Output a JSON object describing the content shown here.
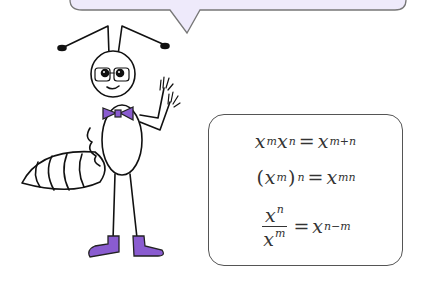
{
  "speech_bubble": {
    "text": "",
    "fill": "#eeeafb",
    "stroke": "#777777"
  },
  "character": {
    "accent_color": "#8a5cd0",
    "description": "cartoon ant with glasses, bow tie and boots"
  },
  "formulas": {
    "f1": {
      "lhs_a": "x",
      "lhs_a_exp": "m",
      "lhs_b": "x",
      "lhs_b_exp": "n",
      "op": "=",
      "rhs": "x",
      "rhs_exp": "m+n"
    },
    "f2": {
      "open": "(",
      "base": "x",
      "inner_exp": "m",
      "close": ")",
      "outer_exp": "n",
      "op": "=",
      "rhs": "x",
      "rhs_exp": "mn"
    },
    "f3": {
      "num": "x",
      "num_exp": "n",
      "den": "x",
      "den_exp": "m",
      "op": "=",
      "rhs": "x",
      "rhs_exp": "n−m"
    }
  }
}
